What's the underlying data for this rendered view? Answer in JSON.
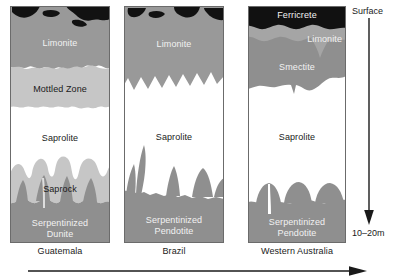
{
  "figure": {
    "columns": [
      {
        "id": "guatemala",
        "label": "Guatemala",
        "x": 10,
        "width": 100,
        "layers": [
          {
            "name": "Limonite",
            "label": "Limonite",
            "color": "#999999",
            "text_color": "light"
          },
          {
            "name": "Mottled Zone",
            "label": "Mottled Zone",
            "color": "#c6c6c6",
            "text_color": "dark"
          },
          {
            "name": "Saprolite",
            "label": "Saprolite",
            "color": "#ffffff",
            "text_color": "dark"
          },
          {
            "name": "Saprock",
            "label": "Saprock",
            "color": "#c6c6c6",
            "text_color": "dark"
          },
          {
            "name": "Serpentinized Dunite",
            "label": "Serpentinized\nDunite",
            "color": "#8f8f8f",
            "text_color": "light"
          }
        ]
      },
      {
        "id": "brazil",
        "label": "Brazil",
        "x": 124,
        "width": 100,
        "layers": [
          {
            "name": "Limonite",
            "label": "Limonite",
            "color": "#999999",
            "text_color": "light"
          },
          {
            "name": "Saprolite",
            "label": "Saprolite",
            "color": "#ffffff",
            "text_color": "dark"
          },
          {
            "name": "Serpentinized Peridotite",
            "label": "Serpentinized\nPendotite",
            "color": "#8f8f8f",
            "text_color": "light"
          }
        ]
      },
      {
        "id": "western-australia",
        "label": "Western Australia",
        "x": 248,
        "width": 98,
        "layers": [
          {
            "name": "Ferricrete",
            "label": "Ferricrete",
            "color": "#111111",
            "text_color": "light"
          },
          {
            "name": "Limonite",
            "label": "Limonite",
            "color": "#a5a5a5",
            "text_color": "light"
          },
          {
            "name": "Smectite",
            "label": "Smectite",
            "color": "#8f8f8f",
            "text_color": "light"
          },
          {
            "name": "Saprolite",
            "label": "Saprolite",
            "color": "#ffffff",
            "text_color": "dark"
          },
          {
            "name": "Serpentinized Peridotite",
            "label": "Serpentinized\nPendotite",
            "color": "#8f8f8f",
            "text_color": "light"
          }
        ]
      }
    ],
    "depth_axis": {
      "top_label": "Surface",
      "bottom_label": "10–20m",
      "direction": "down"
    },
    "bottom_axis": {
      "direction": "right",
      "caption": ""
    }
  }
}
